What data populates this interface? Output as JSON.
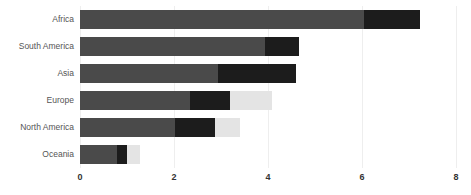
{
  "chart_data": {
    "type": "bar",
    "orientation": "horizontal",
    "stacked": true,
    "title": "",
    "xlabel": "",
    "ylabel": "",
    "categories": [
      "Africa",
      "South America",
      "Asia",
      "Europe",
      "North America",
      "Oceania"
    ],
    "series": [
      {
        "name": "segment-1",
        "color": "#4a4a4a",
        "values": [
          6.05,
          3.93,
          2.93,
          2.34,
          2.02,
          0.79
        ]
      },
      {
        "name": "segment-2",
        "color": "#1c1c1c",
        "values": [
          1.18,
          0.74,
          1.67,
          0.85,
          0.85,
          0.21
        ]
      },
      {
        "name": "segment-3",
        "color": "#e4e4e4",
        "values": [
          0.0,
          0.0,
          0.0,
          0.89,
          0.53,
          0.28
        ]
      }
    ],
    "totals": [
      7.23,
      4.67,
      4.6,
      4.08,
      3.4,
      1.28
    ],
    "xticks": [
      0,
      2,
      4,
      6,
      8
    ],
    "xtick_labels": [
      "0",
      "2",
      "4",
      "6",
      "8"
    ],
    "xlim": [
      0,
      8
    ],
    "grid": true,
    "grid_color": "#eeeeee",
    "legend": "none",
    "background": "#ffffff",
    "label_color": "#555555",
    "tick_color": "#333333"
  }
}
